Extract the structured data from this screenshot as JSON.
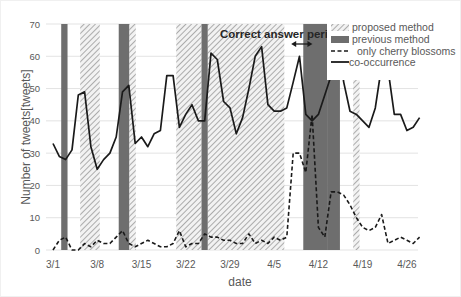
{
  "chart_data": {
    "type": "line",
    "title": "",
    "xlabel": "date",
    "ylabel": "Number of tweets[tweets]",
    "ylim": [
      0,
      70
    ],
    "yticks": [
      0,
      10,
      20,
      30,
      40,
      50,
      60,
      70
    ],
    "xtick_labels": [
      "3/1",
      "3/8",
      "3/15",
      "3/22",
      "3/29",
      "4/5",
      "4/12",
      "4/19",
      "4/26"
    ],
    "grid": true,
    "legend_position": "upper right",
    "legend": [
      {
        "label": "proposed method",
        "style": "hatched"
      },
      {
        "label": "previous method",
        "style": "dark-gray-fill"
      },
      {
        "label": "only cherry blossoms",
        "style": "dashed-line"
      },
      {
        "label": "co-occurrence",
        "style": "solid-line"
      }
    ],
    "annotation": {
      "text": "Correct answer period",
      "arrow_from_day": 38,
      "arrow_to_day": 42
    },
    "x_days": [
      0,
      1,
      2,
      3,
      4,
      5,
      6,
      7,
      8,
      9,
      10,
      11,
      12,
      13,
      14,
      15,
      16,
      17,
      18,
      19,
      20,
      21,
      22,
      23,
      24,
      25,
      26,
      27,
      28,
      29,
      30,
      31,
      32,
      33,
      34,
      35,
      36,
      37,
      38,
      39,
      40,
      41,
      42,
      43,
      44,
      45,
      46,
      47,
      48,
      49,
      50,
      51,
      52,
      53,
      54,
      55,
      56,
      57
    ],
    "series": [
      {
        "name": "co-occurrence",
        "values": [
          33,
          29,
          28,
          31,
          48,
          49,
          32,
          25,
          28,
          30,
          35,
          49,
          51,
          33,
          35,
          32,
          36,
          37,
          54,
          54,
          38,
          42,
          45,
          40,
          40,
          61,
          59,
          46,
          44,
          36,
          41,
          50,
          60,
          63,
          45,
          43,
          43,
          44,
          52,
          60,
          42,
          40,
          42,
          48,
          54,
          67,
          52,
          43,
          42,
          40,
          38,
          44,
          57,
          56,
          42,
          42,
          37,
          38,
          41
        ]
      },
      {
        "name": "only cherry blossoms",
        "values": [
          0,
          3,
          4,
          0,
          0,
          2,
          1,
          3,
          2,
          2,
          4,
          6,
          2,
          1,
          2,
          3,
          2,
          1,
          1,
          2,
          6,
          1,
          2,
          2,
          5,
          4,
          4,
          3,
          3,
          2,
          2,
          5,
          2,
          3,
          2,
          4,
          3,
          4,
          30,
          30,
          24,
          42,
          7,
          4,
          18,
          18,
          17,
          14,
          10,
          7,
          6,
          7,
          11,
          2,
          3,
          4,
          3,
          2,
          4
        ]
      }
    ],
    "bands": [
      {
        "method": "previous",
        "start_day": 1.3,
        "end_day": 2.3
      },
      {
        "method": "proposed",
        "start_day": 4.3,
        "end_day": 7.4
      },
      {
        "method": "previous",
        "start_day": 10.4,
        "end_day": 12.1
      },
      {
        "method": "proposed",
        "start_day": 12.1,
        "end_day": 13.1
      },
      {
        "method": "proposed",
        "start_day": 19.5,
        "end_day": 23.5
      },
      {
        "method": "previous",
        "start_day": 23.5,
        "end_day": 24.5
      },
      {
        "method": "proposed",
        "start_day": 24.5,
        "end_day": 36.6
      },
      {
        "method": "previous",
        "start_day": 39.6,
        "end_day": 43.5
      },
      {
        "method": "previous",
        "start_day": 43.5,
        "end_day": 45.4,
        "top": 57
      },
      {
        "method": "proposed",
        "start_day": 47.5,
        "end_day": 48.5
      }
    ]
  },
  "colors": {
    "line": "#1a1a1a",
    "previous": "#6e6e6e",
    "proposed_hatch": "#9a9a9a",
    "grid": "#e3e3e3",
    "text": "#595959"
  }
}
